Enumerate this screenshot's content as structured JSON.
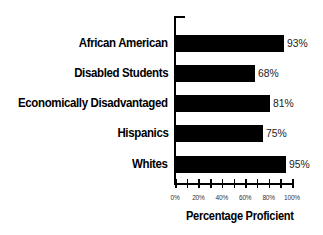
{
  "chart_data": {
    "type": "bar",
    "orientation": "horizontal",
    "title": "",
    "xlabel": "Percentage Proficient",
    "ylabel": "",
    "categories": [
      "African American",
      "Disabled Students",
      "Economically Disadvantaged",
      "Hispanics",
      "Whites"
    ],
    "values": [
      93,
      68,
      81,
      75,
      95
    ],
    "value_labels": [
      "93%",
      "68%",
      "81%",
      "75%",
      "95%"
    ],
    "xlim": [
      0,
      100
    ],
    "x_ticks": [
      "0%",
      "20%",
      "40%",
      "60%",
      "80%",
      "100%"
    ],
    "minor_tick_step": 10,
    "grid": false,
    "legend": null,
    "bar_color": "#000000"
  }
}
